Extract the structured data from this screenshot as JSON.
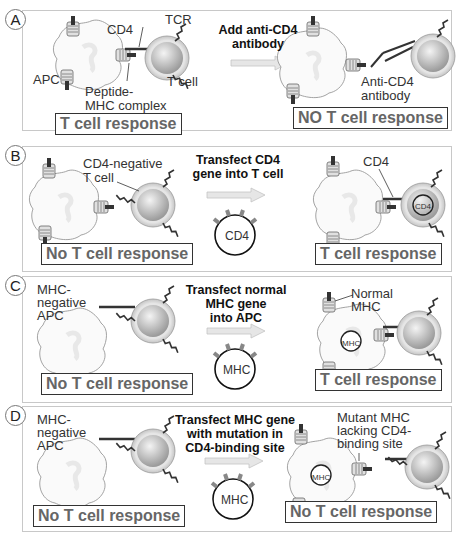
{
  "panels": [
    {
      "letter": "A",
      "labels": {
        "cd4": "CD4",
        "tcr": "TCR",
        "apc": "APC",
        "tcell": "T cell",
        "peptide": "Peptide-",
        "mhc_complex": "MHC complex",
        "anti1": "Anti-CD4",
        "anti2": "antibody"
      },
      "step": [
        "Add anti-CD4",
        "antibody"
      ],
      "left_result": "T cell response",
      "right_result": "NO T cell response"
    },
    {
      "letter": "B",
      "labels": {
        "cd4neg1": "CD4-negative",
        "cd4neg2": "T cell",
        "cd4": "CD4",
        "plasmid": "CD4",
        "cell_gene": "CD4"
      },
      "step": [
        "Transfect CD4",
        "gene into T cell"
      ],
      "left_result": "No T cell response",
      "right_result": "T cell response"
    },
    {
      "letter": "C",
      "labels": {
        "neg1": "MHC-",
        "neg2": "negative",
        "neg3": "APC",
        "normal1": "Normal",
        "normal2": "MHC",
        "plasmid": "MHC",
        "cell_gene": "MHC"
      },
      "step": [
        "Transfect normal",
        "MHC gene",
        "into APC"
      ],
      "left_result": "No T cell response",
      "right_result": "T cell response"
    },
    {
      "letter": "D",
      "labels": {
        "neg1": "MHC-",
        "neg2": "negative",
        "neg3": "APC",
        "mut1": "Mutant MHC",
        "mut2": "lacking CD4-",
        "mut3": "binding site",
        "plasmid": "MHC",
        "cell_gene": "MHC"
      },
      "step": [
        "Transfect MHC gene",
        "with mutation in",
        "CD4-binding site"
      ],
      "left_result": "No T cell response",
      "right_result": "No T cell response"
    }
  ],
  "colors": {
    "border": "#c8c8c8",
    "arrow": "#d6d6d6",
    "tcell_outer": "#d0d0d0",
    "tcell_inner": "#b8b8b8"
  }
}
